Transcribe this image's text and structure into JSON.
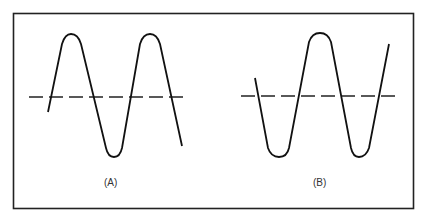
{
  "diagram": {
    "panels": [
      {
        "id": "A",
        "label": "(A)",
        "description": "Sine-like waveform crossing dashed reference line; starts rising"
      },
      {
        "id": "B",
        "label": "(B)",
        "description": "Sine-like waveform crossing dashed reference line; starts falling"
      }
    ],
    "colors": {
      "stroke": "#1a1a1a",
      "background": "#ffffff"
    }
  }
}
